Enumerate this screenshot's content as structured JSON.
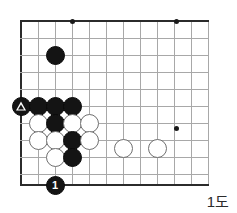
{
  "diagram": {
    "caption": "1도",
    "kind": "go-board-diagram",
    "board": {
      "origin_x": 21,
      "origin_y": 21,
      "spacing": 17,
      "cols": 12,
      "rows": 10,
      "bottom_edge_y": 185,
      "grid_color": "#a8a8a8",
      "edge_color": "#2b2b2b",
      "background": "#ffffff"
    },
    "star_points": [
      {
        "name": "star-point-top-left",
        "x": 72,
        "y": 21
      },
      {
        "name": "star-point-top-right",
        "x": 176,
        "y": 21
      },
      {
        "name": "star-point-right",
        "x": 176,
        "y": 128
      }
    ],
    "stones": [
      {
        "name": "black-stone-marked-triangle",
        "color": "black",
        "x": 21,
        "y": 106,
        "mark": "triangle",
        "label": ""
      },
      {
        "name": "black-stone-upper",
        "color": "black",
        "x": 55,
        "y": 55,
        "mark": "",
        "label": ""
      },
      {
        "name": "black-stone-row1-a",
        "color": "black",
        "x": 38,
        "y": 106,
        "mark": "",
        "label": ""
      },
      {
        "name": "black-stone-row1-b",
        "color": "black",
        "x": 55,
        "y": 106,
        "mark": "",
        "label": ""
      },
      {
        "name": "black-stone-row1-c",
        "color": "black",
        "x": 72,
        "y": 106,
        "mark": "",
        "label": ""
      },
      {
        "name": "white-stone-row2-a",
        "color": "white",
        "x": 38,
        "y": 123,
        "mark": "",
        "label": ""
      },
      {
        "name": "black-stone-row2-b",
        "color": "black",
        "x": 55,
        "y": 123,
        "mark": "",
        "label": ""
      },
      {
        "name": "white-stone-row2-c",
        "color": "white",
        "x": 72,
        "y": 123,
        "mark": "",
        "label": ""
      },
      {
        "name": "white-stone-row2-d",
        "color": "white",
        "x": 89,
        "y": 123,
        "mark": "",
        "label": ""
      },
      {
        "name": "white-stone-row3-a",
        "color": "white",
        "x": 38,
        "y": 140,
        "mark": "",
        "label": ""
      },
      {
        "name": "white-stone-row3-b",
        "color": "white",
        "x": 55,
        "y": 140,
        "mark": "",
        "label": ""
      },
      {
        "name": "black-stone-row3-c",
        "color": "black",
        "x": 72,
        "y": 140,
        "mark": "",
        "label": ""
      },
      {
        "name": "white-stone-row3-d",
        "color": "white",
        "x": 89,
        "y": 140,
        "mark": "",
        "label": ""
      },
      {
        "name": "white-stone-row4-a",
        "color": "white",
        "x": 55,
        "y": 157,
        "mark": "",
        "label": ""
      },
      {
        "name": "black-stone-row4-b",
        "color": "black",
        "x": 72,
        "y": 157,
        "mark": "",
        "label": ""
      },
      {
        "name": "white-stone-isolated-left",
        "color": "white",
        "x": 123,
        "y": 148,
        "mark": "",
        "label": ""
      },
      {
        "name": "white-stone-isolated-right",
        "color": "white",
        "x": 157,
        "y": 148,
        "mark": "",
        "label": ""
      },
      {
        "name": "black-stone-move-1",
        "color": "black",
        "x": 55,
        "y": 185,
        "mark": "",
        "label": "1"
      }
    ]
  }
}
